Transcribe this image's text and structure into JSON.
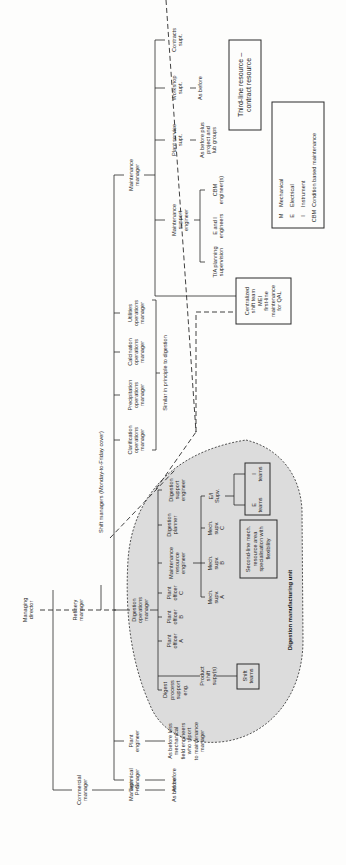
{
  "diagram": {
    "orientation": "rotated -90deg (read bottom-to-top)",
    "nodes": {
      "managing_director": [
        "Managing",
        "director"
      ],
      "refinery_manager": [
        "Refinery",
        "manager"
      ],
      "commercial_manager": [
        "Commercial",
        "manager"
      ],
      "manager_ps": [
        "Manager",
        "P+S"
      ],
      "manager_ps_child": [
        "As before"
      ],
      "technical_manager": [
        "Technical",
        "manager"
      ],
      "technical_child": [
        "As before"
      ],
      "plant_engineer": [
        "Plant",
        "engineer"
      ],
      "plant_engineer_child": [
        "As before less",
        "mechanical",
        "field engineers",
        "who report",
        "to maintenance",
        "manager"
      ],
      "shift_managers": [
        "Shift managers (Monday-to-Friday cover)"
      ],
      "digestion_ops_manager": [
        "Digestion",
        "operations",
        "manager"
      ],
      "digest_process_support": [
        "Digest",
        "process",
        "support",
        "eng."
      ],
      "product_shift_supv": [
        "Product",
        "shift",
        "supv(s)"
      ],
      "shift_teams": [
        "Shift",
        "teams"
      ],
      "plant_officer_a": [
        "Plant",
        "officer",
        "A"
      ],
      "plant_officer_b": [
        "Plant",
        "officer",
        "B"
      ],
      "plant_officer_c": [
        "Plant",
        "officer",
        "C"
      ],
      "maintenance_resource_engineer": [
        "Maintenance",
        "resource",
        "engineer"
      ],
      "mech_supv_a": [
        "Mech.",
        "supv.",
        "A"
      ],
      "mech_supv_b": [
        "Mech.",
        "supv.",
        "B"
      ],
      "mech_supv_c": [
        "Mech.",
        "supv.",
        "C"
      ],
      "ei_supv": [
        "E/I",
        "Supv."
      ],
      "second_line": [
        "Second-line mech.",
        "resource area",
        "specialisation with",
        "flexibility"
      ],
      "e_teams": [
        "E",
        "teams"
      ],
      "i_teams": [
        "I",
        "teams"
      ],
      "digestion_planner": [
        "Digestion",
        "planner"
      ],
      "digestion_support_engineer": [
        "Digestion",
        "support",
        "engineer"
      ],
      "clarification_ops": [
        "Clarification",
        "operations",
        "manager"
      ],
      "precipitation_ops": [
        "Precipitation",
        "operations",
        "manager"
      ],
      "calcination_ops": [
        "Calcination",
        "operations",
        "manager"
      ],
      "utilities_ops": [
        "Utilities",
        "operations",
        "manager"
      ],
      "similar_note": [
        "Similar in principle to digestion"
      ],
      "centralized_shift": [
        "Centralized",
        "shift team",
        "MEI",
        "first-line",
        "maintenance",
        "for QAL"
      ],
      "maintenance_manager": [
        "Maintenance",
        "manager"
      ],
      "maintenance_support_engineer": [
        "Maintenance",
        "support",
        "engineer"
      ],
      "ta_planning": [
        "T/A planning",
        "supervision"
      ],
      "e_and_i_engineers": [
        "E and I",
        "engineers"
      ],
      "cbm_engineers": [
        "CBM",
        "engineer(s)"
      ],
      "plant_service_supt": [
        "Plant service",
        "supt."
      ],
      "plant_service_child": [
        "As before plus",
        "project and",
        "lub groups"
      ],
      "workshop_supt": [
        "Workshop",
        "supt."
      ],
      "workshop_child": [
        "As before"
      ],
      "contracts_supt": [
        "Contracts",
        "supt."
      ],
      "third_line": [
        "Third-line resource –",
        "contract resource"
      ]
    },
    "unit_label": "Digestion manufacturing unit",
    "legend": [
      {
        "code": "M",
        "meaning": "Mechanical"
      },
      {
        "code": "E",
        "meaning": "Electrical"
      },
      {
        "code": "I",
        "meaning": "Instrument"
      },
      {
        "code": "CBM",
        "meaning": "Condition based maintenance"
      }
    ],
    "colors": {
      "line": "#2a2a2a",
      "unit_fill": "#dcdcdc",
      "background": "#fdfdfc"
    }
  }
}
